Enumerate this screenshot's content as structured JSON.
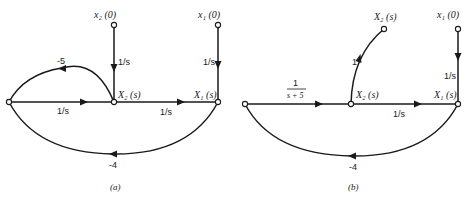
{
  "figure": {
    "panels": [
      {
        "id": "a",
        "caption": "(a)",
        "nodes": {
          "x2_init": "x₂ (0)",
          "x1_init": "x₁ (0)",
          "X2": "X₂ (s)",
          "X1": "X₁ (s)"
        },
        "edges": {
          "x2_init_to_X2": "1/s",
          "x1_init_to_X1": "1/s",
          "left_to_X2": "1/s",
          "X2_to_X1": "1/s",
          "self_loop_X2_to_left": "-5",
          "X1_to_left": "-4"
        }
      },
      {
        "id": "b",
        "caption": "(b)",
        "nodes": {
          "X2_out": "X₂ (s)",
          "x1_init": "x₁ (0)",
          "X2": "X₂ (s)",
          "X1": "X₁ (s)"
        },
        "edges": {
          "left_to_X2_num": "1",
          "left_to_X2_den": "s + 5",
          "X2_to_X2_out": "1",
          "x1_init_to_X1": "1/s",
          "X2_to_X1": "1/s",
          "X1_to_left": "-4"
        }
      }
    ]
  }
}
